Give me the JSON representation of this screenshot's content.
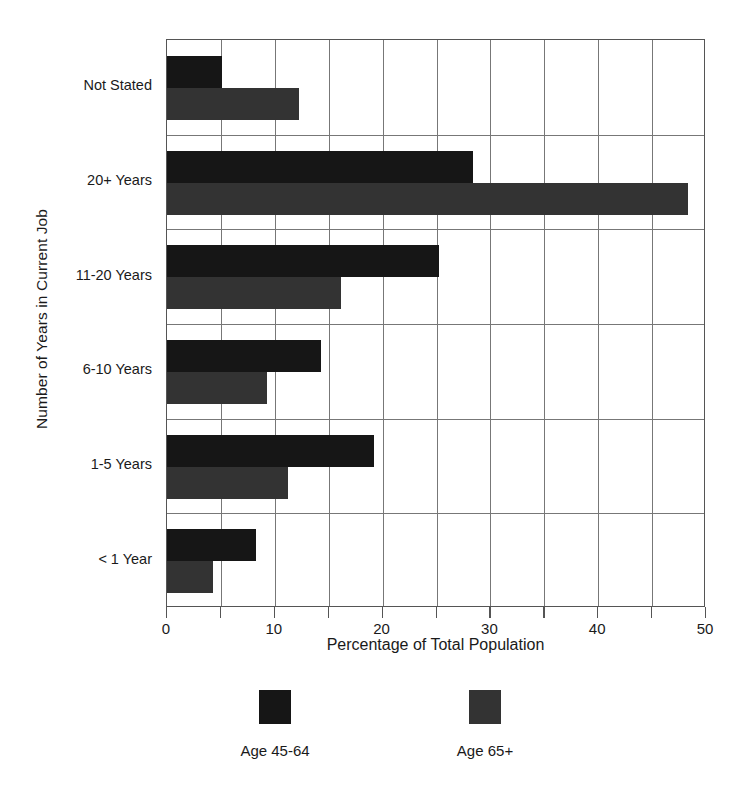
{
  "chart_data": {
    "type": "bar",
    "orientation": "horizontal",
    "title": "",
    "xlabel": "Percentage of Total Population",
    "ylabel": "Number of Years in Current Job",
    "categories": [
      "< 1 Year",
      "1-5 Years",
      "6-10 Years",
      "11-20 Years",
      "20+ Years",
      "Not Stated"
    ],
    "series": [
      {
        "name": "Age 45-64",
        "color": "#161616",
        "values": [
          8.3,
          19.2,
          14.3,
          25.2,
          28.4,
          5.1
        ]
      },
      {
        "name": "Age 65+",
        "color": "#333333",
        "values": [
          4.3,
          11.2,
          9.3,
          16.1,
          48.3,
          12.2
        ]
      }
    ],
    "xlim": [
      0,
      50
    ],
    "xticks": [
      0,
      5,
      10,
      15,
      20,
      25,
      30,
      35,
      40,
      45,
      50
    ],
    "xtick_labels": [
      "0",
      "",
      "10",
      "",
      "20",
      "",
      "30",
      "",
      "40",
      "",
      "50"
    ],
    "grid": "vertical-gridlines-and-category-separators",
    "legend_position": "bottom"
  },
  "legend": {
    "items": [
      {
        "label": "Age 45-64"
      },
      {
        "label": "Age 65+"
      }
    ]
  }
}
